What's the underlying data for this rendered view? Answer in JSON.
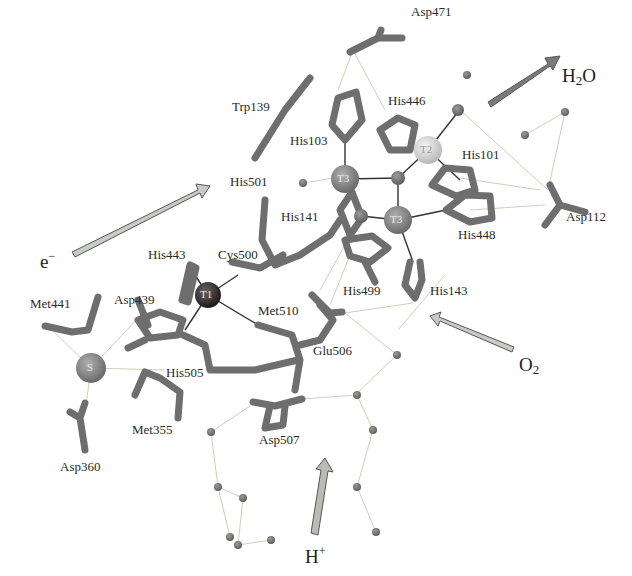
{
  "copper_sites": [
    {
      "id": "T1",
      "label": "T1",
      "x": 208,
      "y": 295,
      "r": 13,
      "color": "#2e2a2a"
    },
    {
      "id": "T2",
      "label": "T2",
      "x": 428,
      "y": 150,
      "r": 14,
      "color": "#d9d9d9"
    },
    {
      "id": "T3a",
      "label": "T3",
      "x": 345,
      "y": 179,
      "r": 14,
      "color": "#8a8a8a"
    },
    {
      "id": "T3b",
      "label": "T3",
      "x": 398,
      "y": 220,
      "r": 14,
      "color": "#8a8a8a"
    },
    {
      "id": "S",
      "label": "S",
      "x": 91,
      "y": 368,
      "r": 15,
      "color": "#8c8c8c"
    }
  ],
  "residues": [
    {
      "name": "Asp471",
      "x": 411,
      "y": 5
    },
    {
      "name": "Trp139",
      "x": 232,
      "y": 100
    },
    {
      "name": "His446",
      "x": 388,
      "y": 94
    },
    {
      "name": "His103",
      "x": 290,
      "y": 134
    },
    {
      "name": "His101",
      "x": 462,
      "y": 148
    },
    {
      "name": "His501",
      "x": 230,
      "y": 175
    },
    {
      "name": "His141",
      "x": 281,
      "y": 210
    },
    {
      "name": "Asp112",
      "x": 566,
      "y": 210
    },
    {
      "name": "His448",
      "x": 458,
      "y": 228
    },
    {
      "name": "His443",
      "x": 148,
      "y": 248
    },
    {
      "name": "Cys500",
      "x": 218,
      "y": 248
    },
    {
      "name": "Asp439",
      "x": 114,
      "y": 293
    },
    {
      "name": "Met441",
      "x": 30,
      "y": 297
    },
    {
      "name": "His499",
      "x": 343,
      "y": 284
    },
    {
      "name": "His143",
      "x": 430,
      "y": 284
    },
    {
      "name": "Met510",
      "x": 258,
      "y": 304
    },
    {
      "name": "Glu506",
      "x": 313,
      "y": 344
    },
    {
      "name": "His505",
      "x": 166,
      "y": 366
    },
    {
      "name": "Met355",
      "x": 132,
      "y": 423
    },
    {
      "name": "Asp507",
      "x": 259,
      "y": 433
    },
    {
      "name": "Asp360",
      "x": 60,
      "y": 460
    }
  ],
  "pathways": [
    {
      "id": "electron",
      "label": "e",
      "superscript": "−",
      "x": 40,
      "y": 250
    },
    {
      "id": "water",
      "label": "H",
      "subscript": "2",
      "suffix": "O",
      "x": 562,
      "y": 66
    },
    {
      "id": "oxygen",
      "label": "O",
      "subscript": "2",
      "x": 519,
      "y": 355
    },
    {
      "id": "proton",
      "label": "H",
      "superscript": "+",
      "x": 305,
      "y": 545
    }
  ],
  "colors": {
    "stick": "#6e6e6e",
    "stick_dark": "#555555",
    "water": "#7a7a7a",
    "hbond": "#c8c8b0",
    "arrow_light": "#c9ccc4",
    "arrow_dark": "#7a7a7a",
    "text": "#2a2a2a"
  }
}
